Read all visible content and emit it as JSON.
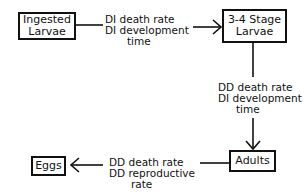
{
  "nodes": {
    "ingested_larvae": {
      "line1": "Ingested",
      "line2": "Larvae"
    },
    "stage_larvae": {
      "line1": "3-4 Stage",
      "line2": "Larvae"
    },
    "adults": {
      "label": "Adults"
    },
    "eggs": {
      "label": "Eggs"
    }
  },
  "edges": {
    "ingested_to_stage": {
      "line1": "DI death rate",
      "line2": "DI development",
      "line3": "time"
    },
    "stage_to_adults": {
      "line1": "DD death rate",
      "line2": "DI development",
      "line3": "time"
    },
    "adults_to_eggs": {
      "line1": "DD death rate",
      "line2": "DD reproductive",
      "line3": "rate"
    }
  }
}
